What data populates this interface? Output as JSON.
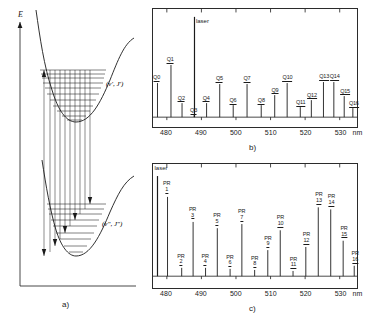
{
  "figure": {
    "panel_a_caption": "a)",
    "panel_b_caption": "b)",
    "panel_c_caption": "c)",
    "energy_axis_label": "E",
    "upper_state_label": "(v', J')",
    "lower_state_label": "(v\", J\")",
    "ink_color": "#1a1a1a"
  },
  "chart_data": [
    {
      "type": "line",
      "panel": "a",
      "title": "",
      "xlabel": "",
      "ylabel": "E",
      "description": "Two Morse potential energy curves with vibrational-rotational levels and vertical absorption / fluorescence transitions",
      "annotations": [
        "(v', J')",
        "(v\", J\")",
        "a)"
      ],
      "curves": [
        {
          "name": "upper-state-potential",
          "state": "(v', J')",
          "levels": 11
        },
        {
          "name": "lower-state-potential",
          "state": "(v\", J\")",
          "levels": 9
        }
      ]
    },
    {
      "type": "bar",
      "panel": "b",
      "title": "",
      "xlabel": "nm",
      "ylabel": "",
      "xlim": [
        476.0,
        535.0
      ],
      "ylim": [
        0,
        100
      ],
      "grid": false,
      "legend": null,
      "xticks": [
        480,
        490,
        500,
        510,
        520,
        530
      ],
      "xtick_labels": [
        "480",
        "490",
        "500",
        "510",
        "520",
        "530"
      ],
      "unit": "nm",
      "annotations": [
        "laser",
        "b)"
      ],
      "series": [
        {
          "name": "Q-branch fluorescence",
          "labels": [
            "laser",
            "Q0",
            "Q1",
            "Q2",
            "Q3",
            "Q4",
            "Q5",
            "Q6",
            "Q7",
            "Q8",
            "Q9",
            "Q10",
            "Q11",
            "Q12",
            "Q13",
            "Q14",
            "Q15",
            "Q16"
          ],
          "x": [
            488.0,
            477.3,
            481.2,
            484.4,
            487.9,
            491.5,
            495.3,
            499.2,
            503.2,
            507.3,
            511.2,
            514.8,
            518.6,
            521.8,
            525.3,
            528.3,
            531.3,
            533.8
          ],
          "y": [
            100,
            34,
            52,
            14,
            2,
            14,
            33,
            12,
            33,
            12,
            22,
            34,
            10,
            17,
            35,
            35,
            21,
            9
          ]
        }
      ]
    },
    {
      "type": "bar",
      "panel": "c",
      "title": "",
      "xlabel": "nm",
      "ylabel": "",
      "xlim": [
        476.0,
        535.0
      ],
      "ylim": [
        0,
        100
      ],
      "grid": false,
      "legend": null,
      "xticks": [
        480,
        490,
        500,
        510,
        520,
        530
      ],
      "xtick_labels": [
        "480",
        "490",
        "500",
        "510",
        "520",
        "530"
      ],
      "unit": "nm",
      "annotations": [
        "laser",
        "c)"
      ],
      "series": [
        {
          "name": "P,R-branch fluorescence doublets",
          "labels": [
            "laser",
            "PR 1",
            "PR 2",
            "PR 3",
            "PR 4",
            "PR 5",
            "PR 6",
            "PR 7",
            "PR 8",
            "PR 9",
            "PR 10",
            "PR 11",
            "PR 12",
            "PR 13",
            "PR 14",
            "PR 15",
            "PR 16"
          ],
          "branch_label": "PR",
          "numbers": [
            1,
            2,
            3,
            4,
            5,
            6,
            7,
            8,
            9,
            10,
            11,
            12,
            13,
            14,
            15,
            16
          ],
          "x": [
            477.3,
            480.2,
            484.3,
            487.6,
            491.2,
            494.6,
            498.3,
            501.7,
            505.4,
            509.2,
            512.8,
            516.5,
            520.2,
            523.8,
            527.4,
            531.0,
            534.2
          ],
          "y": [
            96,
            76,
            8,
            52,
            8,
            46,
            7,
            50,
            6,
            25,
            44,
            5,
            28,
            66,
            64,
            34,
            10
          ]
        }
      ]
    }
  ]
}
